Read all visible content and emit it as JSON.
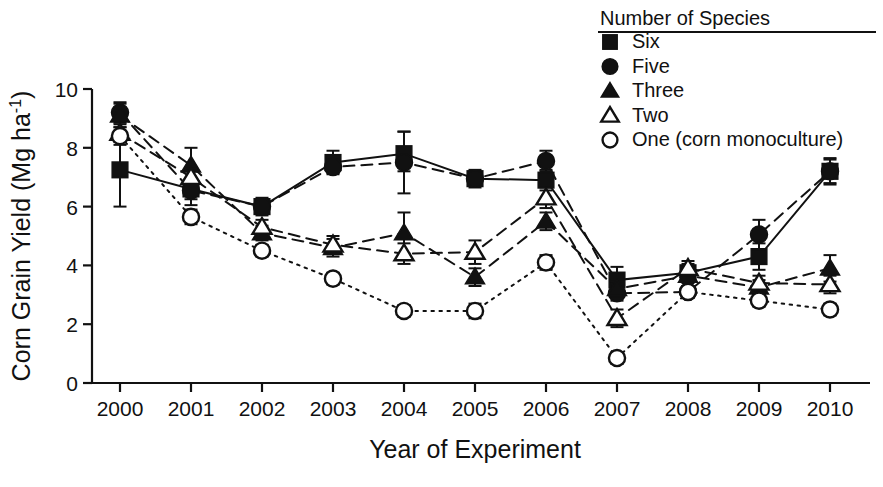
{
  "chart_data": {
    "type": "line",
    "title": "",
    "xlabel": "Year of Experiment",
    "ylabel": "Corn Grain Yield (Mg ha⁻¹)",
    "ylabel_main": "Corn Grain Yield (Mg ha",
    "ylabel_sup": "-1",
    "ylabel_tail": ")",
    "categories": [
      "2000",
      "2001",
      "2002",
      "2003",
      "2004",
      "2005",
      "2006",
      "2007",
      "2008",
      "2009",
      "2010"
    ],
    "x": [
      2000,
      2001,
      2002,
      2003,
      2004,
      2005,
      2006,
      2007,
      2008,
      2009,
      2010
    ],
    "xlim": [
      1999.6,
      2010.45
    ],
    "ylim": [
      0,
      10
    ],
    "yticks": [
      0,
      2,
      4,
      6,
      8,
      10
    ],
    "ytick_labels": [
      "0",
      "2",
      "4",
      "6",
      "8",
      "10"
    ],
    "grid": false,
    "legend_position": "top-right",
    "legend_title": "Number of Species",
    "series": [
      {
        "name": "Six",
        "marker": "filled-square",
        "linestyle": "solid",
        "values": [
          7.25,
          6.6,
          6.0,
          7.5,
          7.8,
          6.95,
          6.9,
          3.5,
          3.75,
          4.3,
          7.2
        ],
        "err_low": [
          6.0,
          6.05,
          5.7,
          7.15,
          7.2,
          6.65,
          6.55,
          3.05,
          3.45,
          3.85,
          6.75
        ],
        "err_high": [
          8.5,
          7.2,
          6.3,
          7.9,
          8.55,
          7.25,
          7.25,
          3.95,
          4.05,
          4.75,
          7.65
        ]
      },
      {
        "name": "Five",
        "marker": "filled-circle",
        "linestyle": "dashed",
        "values": [
          9.2,
          6.55,
          6.0,
          7.35,
          7.5,
          6.95,
          7.55,
          3.05,
          3.1,
          5.05,
          7.2
        ],
        "err_low": [
          8.85,
          6.25,
          5.75,
          7.1,
          6.45,
          6.7,
          7.2,
          2.8,
          2.95,
          4.55,
          6.8
        ],
        "err_high": [
          9.55,
          6.9,
          6.25,
          7.6,
          8.55,
          7.2,
          7.9,
          3.3,
          3.3,
          5.55,
          7.6
        ]
      },
      {
        "name": "Three",
        "marker": "filled-triangle",
        "linestyle": "dashed",
        "values": [
          9.1,
          7.4,
          5.1,
          4.6,
          5.1,
          3.6,
          5.5,
          3.2,
          3.65,
          3.25,
          3.9
        ],
        "err_low": [
          8.7,
          6.8,
          4.85,
          4.3,
          4.4,
          3.3,
          5.2,
          2.95,
          3.4,
          3.0,
          3.45
        ],
        "err_high": [
          9.5,
          8.0,
          5.35,
          4.9,
          5.8,
          3.9,
          5.8,
          3.45,
          3.9,
          3.5,
          4.35
        ]
      },
      {
        "name": "Two",
        "marker": "open-triangle",
        "linestyle": "dashed",
        "values": [
          8.5,
          7.0,
          5.3,
          4.7,
          4.4,
          4.45,
          6.3,
          2.2,
          3.9,
          3.4,
          3.35
        ],
        "err_low": [
          8.2,
          6.7,
          5.05,
          4.4,
          4.05,
          4.05,
          5.95,
          1.9,
          3.65,
          3.15,
          3.05
        ],
        "err_high": [
          8.8,
          7.3,
          5.55,
          5.0,
          4.75,
          4.85,
          6.65,
          2.5,
          4.15,
          3.65,
          3.65
        ]
      },
      {
        "name": "One (corn monoculture)",
        "marker": "open-circle",
        "linestyle": "dotted",
        "values": [
          8.4,
          5.65,
          4.5,
          3.55,
          2.45,
          2.45,
          4.1,
          0.85,
          3.1,
          2.8,
          2.5
        ],
        "err_low": [
          8.1,
          5.4,
          4.3,
          3.35,
          2.25,
          2.2,
          3.85,
          0.65,
          2.9,
          2.6,
          2.3
        ],
        "err_high": [
          8.7,
          5.9,
          4.7,
          3.75,
          2.65,
          2.7,
          4.35,
          1.05,
          3.3,
          3.0,
          2.7
        ]
      }
    ],
    "legend_entries": [
      {
        "label": "Six",
        "marker": "filled-square"
      },
      {
        "label": "Five",
        "marker": "filled-circle"
      },
      {
        "label": "Three",
        "marker": "filled-triangle"
      },
      {
        "label": "Two",
        "marker": "open-triangle"
      },
      {
        "label": "One (corn monoculture)",
        "marker": "open-circle"
      }
    ],
    "colors": {
      "ink": "#111111",
      "background": "#ffffff"
    }
  }
}
